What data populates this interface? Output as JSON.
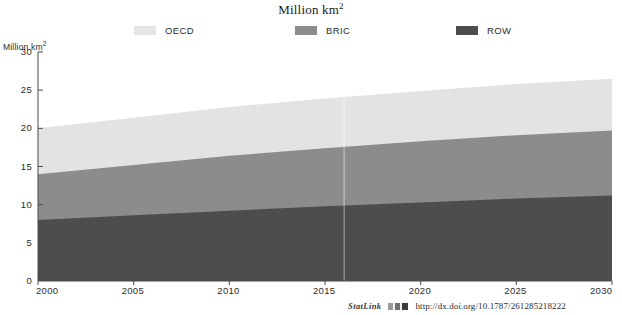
{
  "chart_data": {
    "type": "area",
    "title": "Million km2",
    "title_display": "Million km",
    "title_sup": "2",
    "ylabel": "Million km",
    "ylabel_sup": "2",
    "xlabel": "",
    "ylim": [
      0,
      30
    ],
    "xlim": [
      2000,
      2030
    ],
    "yticks": [
      0,
      5,
      10,
      15,
      20,
      25,
      30
    ],
    "xticks": [
      2000,
      2005,
      2010,
      2015,
      2020,
      2025,
      2030
    ],
    "grid": false,
    "stacked": true,
    "legend_position": "top",
    "x": [
      2000,
      2005,
      2010,
      2015,
      2020,
      2025,
      2030
    ],
    "series": [
      {
        "name": "ROW",
        "color": "#4d4d4d",
        "values": [
          8.0,
          8.6,
          9.2,
          9.8,
          10.3,
          10.8,
          11.2
        ]
      },
      {
        "name": "BRIC",
        "color": "#8c8c8c",
        "values": [
          6.0,
          6.6,
          7.2,
          7.6,
          8.0,
          8.3,
          8.5
        ]
      },
      {
        "name": "OECD",
        "color": "#e3e3e3",
        "values": [
          6.0,
          6.2,
          6.4,
          6.5,
          6.6,
          6.7,
          6.8
        ]
      }
    ],
    "cumulative_tops": {
      "ROW": [
        8.0,
        8.6,
        9.2,
        9.8,
        10.3,
        10.8,
        11.2
      ],
      "BRIC": [
        14.0,
        15.2,
        16.4,
        17.4,
        18.3,
        19.1,
        19.7
      ],
      "OECD": [
        20.0,
        21.4,
        22.8,
        23.9,
        24.9,
        25.8,
        26.5
      ]
    },
    "annotations": {
      "divider_year": 2016
    }
  },
  "legend": {
    "items": [
      {
        "label": "OECD",
        "color": "#e6e6e6"
      },
      {
        "label": "BRIC",
        "color": "#8c8c8c"
      },
      {
        "label": "ROW",
        "color": "#4d4d4d"
      }
    ]
  },
  "footer": {
    "statlink_label": "StatLink",
    "url": "http://dx.doi.org/10.1787/261285218222"
  }
}
